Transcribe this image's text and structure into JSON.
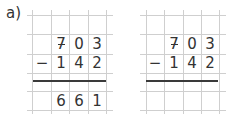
{
  "exercise_label": "a)",
  "problems": [
    {
      "id": "worked",
      "minuend": [
        "7",
        "0",
        "3"
      ],
      "operator": "−",
      "subtrahend": [
        "1",
        "4",
        "2"
      ],
      "result": [
        "6",
        "6",
        "1"
      ]
    },
    {
      "id": "blank",
      "minuend": [
        "7",
        "0",
        "3"
      ],
      "operator": "−",
      "subtrahend": [
        "1",
        "4",
        "2"
      ],
      "result": [
        "",
        "",
        ""
      ]
    }
  ],
  "colors": {
    "grid_line": "#cfcfcf",
    "rule": "#3a3a3a",
    "text": "#333333"
  }
}
